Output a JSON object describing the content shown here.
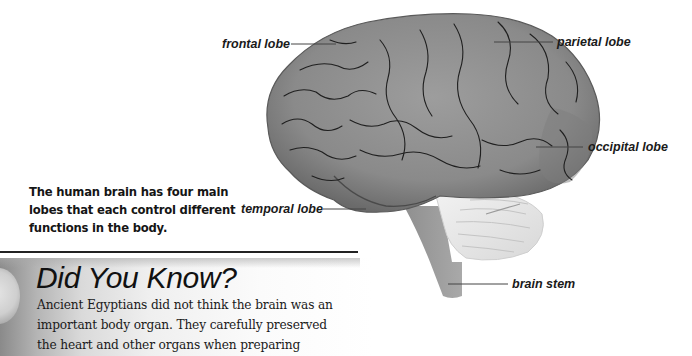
{
  "figure": {
    "labels": {
      "frontal": "frontal lobe",
      "parietal": "parietal lobe",
      "occipital": "occipital lobe",
      "temporal": "temporal lobe",
      "brain_stem": "brain stem"
    },
    "caption": "The human brain has four main lobes that each control different functions in the body."
  },
  "did_you_know": {
    "title": "Did You Know?",
    "body_lines": [
      "Ancient Egyptians did not think the brain was an",
      "important body organ. They carefully preserved",
      "the heart and other organs when preparing"
    ]
  }
}
